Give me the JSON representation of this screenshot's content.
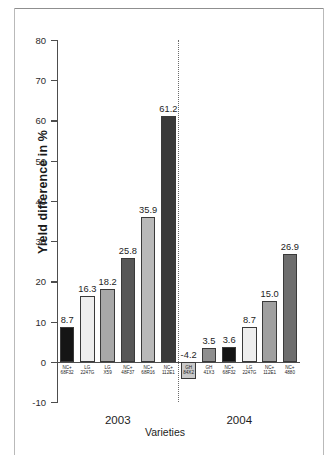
{
  "figure": {
    "background": "#ffffff",
    "frame_color": "#8f8f8f"
  },
  "chart_data": {
    "type": "bar",
    "title": "",
    "xlabel": "Varieties",
    "ylabel": "Yield difference in %",
    "ylim": [
      -10,
      80
    ],
    "yticks": [
      80,
      70,
      60,
      50,
      40,
      30,
      20,
      10,
      0,
      -10
    ],
    "ytick_labels": [
      "80",
      "70",
      "60",
      "50",
      "40",
      "30",
      "20",
      "10",
      "0",
      "-10"
    ],
    "grid": false,
    "legend": "none",
    "group_divider": "dotted-vertical",
    "groups": [
      {
        "name": "2003",
        "label": "2003",
        "categories": [
          "NC+\n68F32",
          "LG\n2247G",
          "LG\nX59",
          "NC+\n48F37",
          "NC+\n68R16",
          "NC+\n112E1"
        ],
        "category_lines": [
          [
            "NC+",
            "68F32"
          ],
          [
            "LG",
            "2247G"
          ],
          [
            "LG",
            "X59"
          ],
          [
            "NC+",
            "48F37"
          ],
          [
            "NC+",
            "68R16"
          ],
          [
            "NC+",
            "112E1"
          ]
        ],
        "values": [
          8.7,
          16.3,
          18.2,
          25.8,
          35.9,
          61.2
        ],
        "value_labels": [
          "8.7",
          "16.3",
          "18.2",
          "25.8",
          "35.9",
          "61.2"
        ],
        "colors": [
          "#151515",
          "#eeeeee",
          "#a8a8a8",
          "#575757",
          "#b9b9b9",
          "#3a3a3a"
        ]
      },
      {
        "name": "2004",
        "label": "2004",
        "categories": [
          "GH\n84X2",
          "GH\n41X3",
          "NC+\n68F32",
          "LG\n2247G",
          "NC+\n112E1",
          "NC+\n4880"
        ],
        "category_lines": [
          [
            "GH",
            "84X2"
          ],
          [
            "GH",
            "41X3"
          ],
          [
            "NC+",
            "68F32"
          ],
          [
            "LG",
            "2247G"
          ],
          [
            "NC+",
            "112E1"
          ],
          [
            "NC+",
            "4880"
          ]
        ],
        "values": [
          -4.2,
          3.5,
          3.6,
          8.7,
          15.0,
          26.9
        ],
        "value_labels": [
          "-4.2",
          "3.5",
          "3.6",
          "8.7",
          "15.0",
          "26.9"
        ],
        "colors": [
          "#c9c9c9",
          "#8f8f8f",
          "#151515",
          "#eeeeee",
          "#a0a0a0",
          "#6e6e6e"
        ]
      }
    ]
  }
}
